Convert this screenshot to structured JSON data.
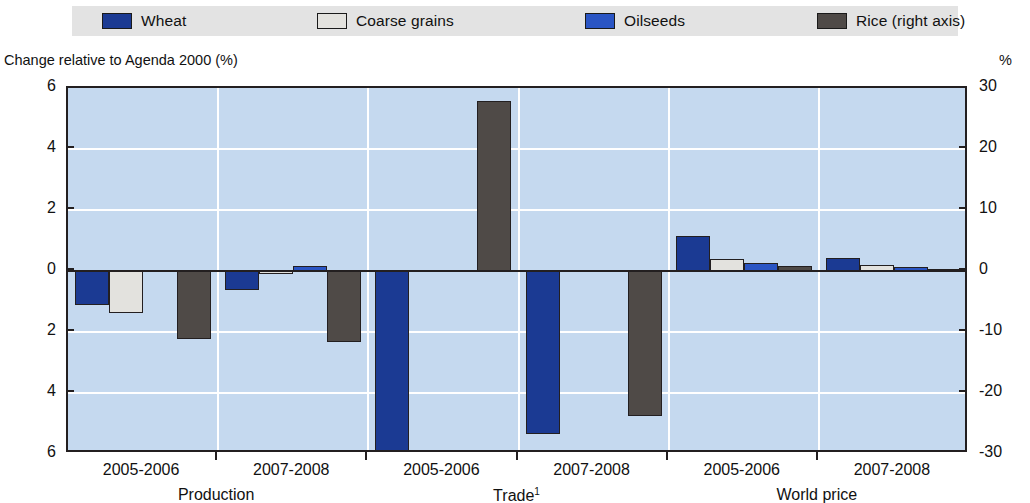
{
  "legend": {
    "items": [
      {
        "label": "Wheat",
        "color": "#1b3a93",
        "key": "wheat"
      },
      {
        "label": "Coarse grains",
        "color": "#e3e2de",
        "key": "coarse_grains"
      },
      {
        "label": "Oilseeds",
        "color": "#2a55c4",
        "key": "oilseeds"
      },
      {
        "label": "Rice (right axis)",
        "color": "#4f4a47",
        "key": "rice"
      }
    ]
  },
  "axes": {
    "left_title": "Change relative to Agenda 2000 (%)",
    "right_title": "%",
    "left_ticks": [
      "6",
      "4",
      "2",
      "0",
      "2",
      "4",
      "6"
    ],
    "right_ticks": [
      "30",
      "20",
      "10",
      "0",
      "-10",
      "-20",
      "-30"
    ]
  },
  "x": {
    "period_labels": [
      "2005-2006",
      "2007-2008",
      "2005-2006",
      "2007-2008",
      "2005-2006",
      "2007-2008"
    ],
    "section_labels": [
      "Production",
      "Trade",
      "World price"
    ],
    "trade_footnote": "1"
  },
  "chart_data": {
    "type": "bar",
    "title": "",
    "subtitle": "",
    "xlabel": "",
    "ylabel": "Change relative to Agenda 2000 (%)",
    "ylabel_right": "%",
    "ylim": [
      -6,
      6
    ],
    "ylim_right": [
      -30,
      30
    ],
    "yticks": [
      6,
      4,
      2,
      0,
      -2,
      -4,
      -6
    ],
    "yticks_right": [
      30,
      20,
      10,
      0,
      -10,
      -20,
      -30
    ],
    "ytick_labels": [
      "6",
      "4",
      "2",
      "0",
      "2",
      "4",
      "6"
    ],
    "ytick_labels_right": [
      "30",
      "20",
      "10",
      "0",
      "-10",
      "-20",
      "-30"
    ],
    "grid": true,
    "legend_position": "top",
    "categories": [
      "2005-2006",
      "2007-2008",
      "2005-2006",
      "2007-2008",
      "2005-2006",
      "2007-2008"
    ],
    "sections": [
      {
        "name": "Production",
        "categories": [
          "2005-2006",
          "2007-2008"
        ]
      },
      {
        "name": "Trade",
        "categories": [
          "2005-2006",
          "2007-2008"
        ]
      },
      {
        "name": "World price",
        "categories": [
          "2005-2006",
          "2007-2008"
        ]
      }
    ],
    "series": [
      {
        "name": "Wheat",
        "axis": "left",
        "color": "#1b3a93",
        "values": [
          -1.1,
          -0.62,
          -6.4,
          -5.35,
          1.15,
          0.42
        ]
      },
      {
        "name": "Coarse grains",
        "axis": "left",
        "color": "#e3e2de",
        "values": [
          -1.37,
          -0.1,
          0.0,
          0.0,
          0.38,
          0.2
        ]
      },
      {
        "name": "Oilseeds",
        "axis": "left",
        "color": "#2a55c4",
        "values": [
          0.0,
          0.15,
          0.0,
          0.0,
          0.27,
          0.13
        ]
      },
      {
        "name": "Rice (right axis)",
        "axis": "right",
        "color": "#4f4a47",
        "values_right": [
          -11.2,
          -11.6,
          27.8,
          -23.7,
          0.8,
          0.3
        ],
        "values": [
          -2.24,
          -2.32,
          5.56,
          -4.74,
          0.16,
          0.06
        ]
      }
    ]
  }
}
